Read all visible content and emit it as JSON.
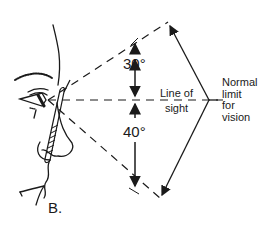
{
  "figure": {
    "panel_label": "B.",
    "upper_angle": "30°",
    "lower_angle": "40°",
    "line_of_sight_label": [
      "Line of",
      "sight"
    ],
    "limit_label": [
      "Normal",
      "limit",
      "for",
      "vision"
    ]
  },
  "colors": {
    "ink": "#1a1a1a",
    "background": "#ffffff"
  }
}
